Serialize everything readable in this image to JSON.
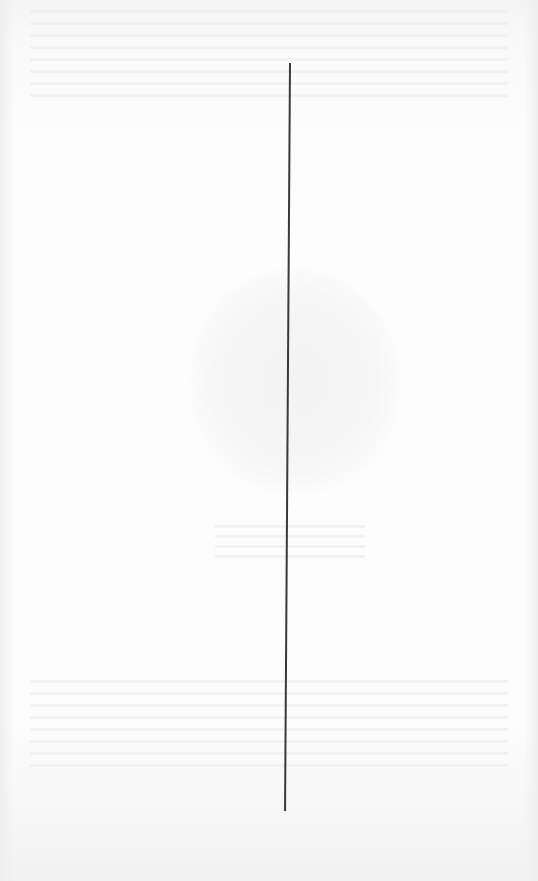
{
  "page": {
    "background_color": "#fbfbfb"
  },
  "divider": {
    "color": "#3a3a3a",
    "top": {
      "x": 292,
      "y": 63
    },
    "bottom": {
      "x": 287,
      "y": 811
    }
  }
}
